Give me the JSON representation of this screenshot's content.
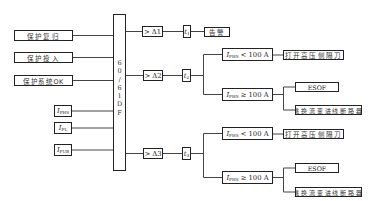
{
  "diagram": {
    "type": "protection-logic-flow",
    "central_block": {
      "label_chars": [
        "6",
        "0",
        "/",
        "6",
        "1",
        "D",
        "F"
      ],
      "label": "60/61DF"
    },
    "inputs": [
      {
        "id": "reset",
        "label": "保护复归"
      },
      {
        "id": "enable",
        "label": "保护投入"
      },
      {
        "id": "system_ok",
        "label": "保护系统OK"
      },
      {
        "id": "i_fhs",
        "symbol": "I",
        "subscript": "FHS"
      },
      {
        "id": "i_fl",
        "symbol": "I",
        "subscript": "FL"
      },
      {
        "id": "i_fub",
        "symbol": "I",
        "subscript": "FUB"
      }
    ],
    "stages": [
      {
        "threshold": "> Δ1",
        "delay": {
          "symbol": "t",
          "subscript": "1"
        },
        "action": "告警"
      },
      {
        "threshold": "> Δ2",
        "delay": {
          "symbol": "t",
          "subscript": "2"
        },
        "branches": [
          {
            "condition": {
              "symbol": "I",
              "subscript": "FHS",
              "relation": "< 100 A"
            },
            "actions": [
              "打开高压侧隔刀"
            ]
          },
          {
            "condition": {
              "symbol": "I",
              "subscript": "FHS",
              "relation": "≥ 100 A"
            },
            "actions": [
              "ESOF",
              "跳换流变进线断路器"
            ]
          }
        ]
      },
      {
        "threshold": "> Δ3",
        "delay": {
          "symbol": "t",
          "subscript": "3"
        },
        "branches": [
          {
            "condition": {
              "symbol": "I",
              "subscript": "FHS",
              "relation": "< 100 A"
            },
            "actions": [
              "打开高压侧隔刀"
            ]
          },
          {
            "condition": {
              "symbol": "I",
              "subscript": "FHS",
              "relation": "≥ 100 A"
            },
            "actions": [
              "ESOF",
              "跳换流变进线断路器"
            ]
          }
        ]
      }
    ],
    "colors": {
      "line": "#444444",
      "border": "#222222",
      "text": "#333333",
      "background": "#ffffff"
    }
  }
}
